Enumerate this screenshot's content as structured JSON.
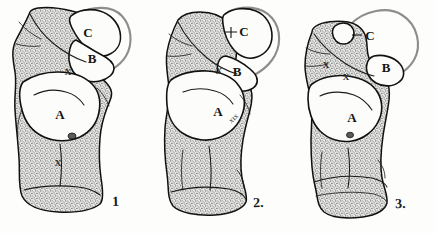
{
  "figure": {
    "background_color": "#fdfdfb",
    "ink_color": "#111111",
    "ghost_outline_color": "#8d8d8d",
    "stipple_color": "#6f6f6f"
  },
  "panels": [
    {
      "number": "1",
      "name": "specimen-1",
      "labels": [
        {
          "text": "C",
          "x": 88,
          "y": 37
        },
        {
          "text": "B",
          "x": 92,
          "y": 63
        },
        {
          "text": "A",
          "x": 60,
          "y": 119
        },
        {
          "text": "X",
          "x": 68,
          "y": 75
        },
        {
          "text": "X",
          "x": 58,
          "y": 166
        }
      ]
    },
    {
      "number": "2.",
      "name": "specimen-2",
      "labels": [
        {
          "text": "C",
          "x": 96,
          "y": 35
        },
        {
          "text": "B",
          "x": 92,
          "y": 74
        },
        {
          "text": "A",
          "x": 73,
          "y": 114
        },
        {
          "text": "X",
          "x": 74,
          "y": 74
        }
      ],
      "annotation": {
        "text": "XIX",
        "x": 90,
        "y": 120
      }
    },
    {
      "number": "3.",
      "name": "specimen-3",
      "labels": [
        {
          "text": "C",
          "x": 60,
          "y": 38
        },
        {
          "text": "B",
          "x": 100,
          "y": 70
        },
        {
          "text": "A",
          "x": 65,
          "y": 120
        },
        {
          "text": "X",
          "x": 56,
          "y": 78
        },
        {
          "text": "X",
          "x": 38,
          "y": 68
        }
      ]
    }
  ],
  "legend": {
    "facet_a": "A",
    "facet_b": "B",
    "facet_c": "C",
    "marker_x": "X"
  }
}
